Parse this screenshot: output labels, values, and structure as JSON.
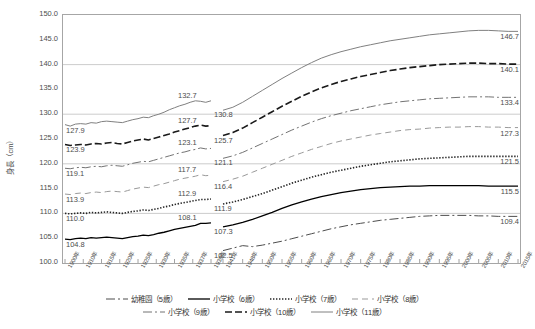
{
  "chart_data": {
    "type": "line",
    "title": "",
    "xlabel": "",
    "ylabel": "身長（cm）",
    "ylim": [
      100.0,
      150.0
    ],
    "ytick_values": [
      150.0,
      145.0,
      140.0,
      135.0,
      130.0,
      125.0,
      120.0,
      115.0,
      110.0,
      105.0,
      100.0
    ],
    "ytick_labels": [
      "150.0",
      "145.0",
      "140.0",
      "135.0",
      "130.0",
      "125.0",
      "120.0",
      "115.0",
      "110.0",
      "105.0",
      "100.0"
    ],
    "gridlines": [
      "150.0",
      "140.0",
      "130.0",
      "120.0",
      "110.0",
      "100.0"
    ],
    "grid": true,
    "legend_position": "bottom",
    "xtick_labels": [
      "1900年",
      "1910年",
      "1915年",
      "1920年",
      "1925年",
      "1930年",
      "1935年",
      "1937年",
      "1939年",
      "1941年",
      "1948年",
      "1950年",
      "1955年",
      "1960年",
      "1965年",
      "1970年",
      "1975年",
      "1980年",
      "1985年",
      "1990年",
      "1995年",
      "2000年",
      "2005年",
      "2010年",
      "2015年"
    ],
    "series": [
      {
        "name": "小学校（11歳）",
        "style": "solid-gray",
        "color": "#808080",
        "start_label": "127.9",
        "gap_left_label": "132.7",
        "gap_right_label": "130.8",
        "end_label": "146.7",
        "values_pre": [
          127.9,
          127.6,
          128.0,
          128.1,
          128.0,
          128.3,
          128.2,
          128.5,
          128.6,
          128.5,
          128.4,
          128.3,
          128.6,
          128.9,
          129.1,
          129.4,
          129.3,
          129.7,
          130.0,
          130.4,
          130.9,
          131.3,
          131.7,
          132.0,
          132.4,
          132.7,
          132.6,
          132.4,
          132.7
        ],
        "values_post": [
          130.8,
          131.4,
          132.4,
          133.6,
          134.8,
          136.0,
          137.2,
          138.3,
          139.4,
          140.4,
          141.3,
          142.0,
          142.6,
          143.1,
          143.6,
          144.0,
          144.4,
          144.8,
          145.1,
          145.4,
          145.7,
          146.0,
          146.2,
          146.4,
          146.6,
          146.8,
          146.9,
          146.9,
          146.8,
          146.7,
          146.7
        ]
      },
      {
        "name": "小学校（10歳）",
        "style": "dashed-black",
        "color": "#1a1a1a",
        "start_label": "123.9",
        "gap_left_label": "127.7",
        "gap_right_label": "125.7",
        "end_label": "140.1",
        "values_pre": [
          123.9,
          123.7,
          123.8,
          123.9,
          123.8,
          124.0,
          124.1,
          124.0,
          124.2,
          124.3,
          124.1,
          124.0,
          124.3,
          124.6,
          124.8,
          125.0,
          124.8,
          125.1,
          125.4,
          125.7,
          126.0,
          126.4,
          126.7,
          127.0,
          127.3,
          127.6,
          127.8,
          127.6,
          127.7
        ],
        "values_post": [
          125.7,
          126.3,
          127.2,
          128.3,
          129.4,
          130.5,
          131.6,
          132.6,
          133.6,
          134.5,
          135.3,
          136.0,
          136.6,
          137.1,
          137.6,
          138.0,
          138.4,
          138.8,
          139.1,
          139.4,
          139.6,
          139.8,
          140.0,
          140.1,
          140.2,
          140.3,
          140.3,
          140.2,
          140.2,
          140.1,
          140.1
        ]
      },
      {
        "name": "小学校（9歳）",
        "style": "dashdot-gray",
        "color": "#737373",
        "start_label": "119.1",
        "gap_left_label": "123.1",
        "gap_right_label": "121.1",
        "end_label": "133.4",
        "values_pre": [
          119.1,
          119.0,
          119.2,
          119.3,
          119.2,
          119.4,
          119.5,
          119.4,
          119.6,
          119.7,
          119.6,
          119.5,
          119.8,
          120.1,
          120.3,
          120.5,
          120.4,
          120.7,
          121.0,
          121.3,
          121.6,
          121.9,
          122.2,
          122.4,
          122.7,
          122.9,
          123.2,
          123.0,
          123.1
        ],
        "values_post": [
          121.1,
          121.6,
          122.3,
          123.2,
          124.1,
          125.0,
          125.9,
          126.8,
          127.6,
          128.4,
          129.1,
          129.7,
          130.2,
          130.7,
          131.1,
          131.5,
          131.9,
          132.2,
          132.5,
          132.7,
          132.9,
          133.1,
          133.2,
          133.3,
          133.4,
          133.5,
          133.5,
          133.5,
          133.4,
          133.4,
          133.4
        ]
      },
      {
        "name": "小学校（8歳）",
        "style": "dashed-gray",
        "color": "#999999",
        "start_label": "113.9",
        "gap_left_label": "117.7",
        "gap_right_label": "116.4",
        "end_label": "127.3",
        "values_pre": [
          113.9,
          113.8,
          114.0,
          114.1,
          114.0,
          114.2,
          114.3,
          114.2,
          114.4,
          114.5,
          114.4,
          114.3,
          114.6,
          114.9,
          115.1,
          115.3,
          115.2,
          115.5,
          115.8,
          116.0,
          116.3,
          116.6,
          116.9,
          117.1,
          117.3,
          117.5,
          117.8,
          117.6,
          117.7
        ],
        "values_post": [
          116.4,
          116.9,
          117.5,
          118.3,
          119.1,
          119.9,
          120.7,
          121.5,
          122.2,
          122.9,
          123.5,
          124.1,
          124.6,
          125.0,
          125.4,
          125.8,
          126.1,
          126.4,
          126.7,
          126.9,
          127.0,
          127.2,
          127.3,
          127.4,
          127.4,
          127.5,
          127.5,
          127.4,
          127.4,
          127.3,
          127.3
        ]
      },
      {
        "name": "小学校（7歳）",
        "style": "dotted-black",
        "color": "#262626",
        "start_label": "110.0",
        "gap_left_label": "112.9",
        "gap_right_label": "111.9",
        "end_label": "121.5",
        "values_pre": [
          110.0,
          109.9,
          110.0,
          110.1,
          110.0,
          110.2,
          110.1,
          110.2,
          110.3,
          110.2,
          110.1,
          110.0,
          110.2,
          110.4,
          110.5,
          110.7,
          110.6,
          110.8,
          111.0,
          111.3,
          111.5,
          111.8,
          112.0,
          112.2,
          112.4,
          112.6,
          112.8,
          112.8,
          112.9
        ],
        "values_post": [
          111.9,
          112.3,
          112.8,
          113.4,
          114.0,
          114.7,
          115.4,
          116.1,
          116.7,
          117.3,
          117.8,
          118.3,
          118.7,
          119.1,
          119.5,
          119.8,
          120.1,
          120.4,
          120.6,
          120.8,
          121.0,
          121.1,
          121.2,
          121.3,
          121.4,
          121.5,
          121.5,
          121.5,
          121.5,
          121.5,
          121.5
        ]
      },
      {
        "name": "小学校（6歳）",
        "style": "solid-black",
        "color": "#000000",
        "start_label": "104.8",
        "gap_left_label": "108.1",
        "gap_right_label": "107.3",
        "end_label": "115.5",
        "values_pre": [
          104.8,
          104.7,
          104.9,
          105.0,
          104.9,
          105.1,
          105.0,
          105.1,
          105.2,
          105.1,
          105.0,
          104.9,
          105.1,
          105.3,
          105.4,
          105.6,
          105.5,
          105.7,
          106.0,
          106.2,
          106.5,
          106.8,
          107.0,
          107.2,
          107.4,
          107.6,
          108.0,
          108.0,
          108.1
        ],
        "values_post": [
          107.3,
          107.7,
          108.2,
          108.8,
          109.5,
          110.2,
          111.0,
          111.7,
          112.3,
          112.9,
          113.4,
          113.8,
          114.2,
          114.5,
          114.8,
          115.0,
          115.2,
          115.3,
          115.4,
          115.5,
          115.5,
          115.6,
          115.6,
          115.6,
          115.6,
          115.6,
          115.6,
          115.5,
          115.5,
          115.5,
          115.5
        ]
      },
      {
        "name": "幼稚園（5歳）",
        "style": "dashdot-dark",
        "color": "#4d4d4d",
        "start_label": "102.5",
        "gap_left_label": "",
        "gap_right_label": "102.5",
        "end_label": "109.4",
        "values_pre": [],
        "values_post": [
          102.5,
          103.0,
          103.5,
          103.3,
          103.6,
          104.0,
          104.4,
          104.9,
          105.4,
          105.9,
          106.4,
          106.9,
          107.3,
          107.7,
          108.0,
          108.3,
          108.6,
          108.8,
          109.0,
          109.2,
          109.4,
          109.5,
          109.6,
          109.6,
          109.6,
          109.6,
          109.5,
          109.5,
          109.4,
          109.4,
          109.4
        ]
      }
    ]
  },
  "legend": {
    "row1": [
      "幼稚園（5歳）",
      "小学校（6歳）",
      "小学校（7歳）",
      "小学校（8歳）"
    ],
    "row2": [
      "小学校（9歳）",
      "小学校（10歳）",
      "小学校（11歳）"
    ]
  }
}
